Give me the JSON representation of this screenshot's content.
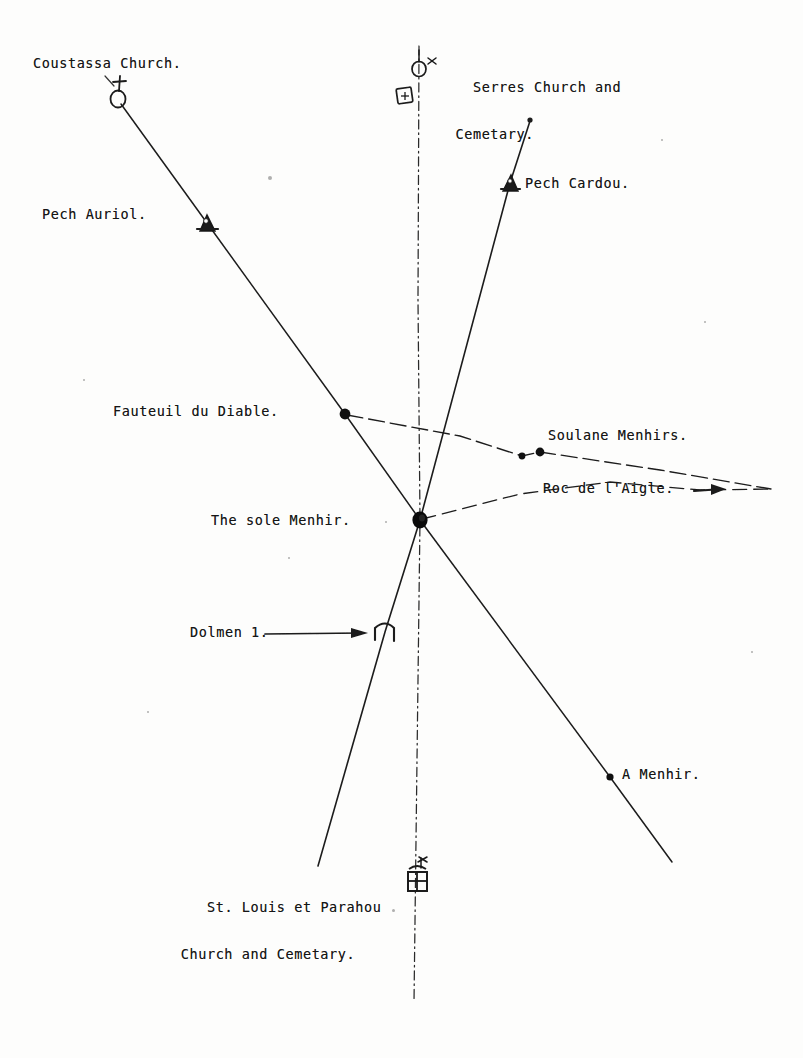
{
  "document": {
    "title": "Alignment plan of the sole Menhir",
    "medium": "typewritten and hand-drawn survey diagram",
    "background_color": "#fdfdfc",
    "ink_color": "#161616",
    "width": 803,
    "height": 1058
  },
  "labels": [
    {
      "id": "coustassa-church",
      "text": "Coustassa Church.",
      "x": 33,
      "y": 52,
      "lines": [
        "Coustassa Church."
      ]
    },
    {
      "id": "serres-church",
      "text": "Serres Church and Cemetary.",
      "x": 438,
      "y": 52,
      "lines": [
        "Serres Church and",
        "  Cemetary."
      ]
    },
    {
      "id": "pech-cardou",
      "text": "Pech Cardou.",
      "x": 525,
      "y": 172,
      "lines": [
        "Pech Cardou."
      ]
    },
    {
      "id": "pech-auriol",
      "text": "Pech Auriol.",
      "x": 42,
      "y": 203,
      "lines": [
        "Pech Auriol."
      ]
    },
    {
      "id": "fauteuil-du-diable",
      "text": "Fauteuil du Diable.",
      "x": 113,
      "y": 400,
      "lines": [
        "Fauteuil du Diable."
      ]
    },
    {
      "id": "soulane-menhirs",
      "text": "Soulane Menhirs.",
      "x": 548,
      "y": 424,
      "lines": [
        "Soulane Menhirs."
      ]
    },
    {
      "id": "roc-de-laigle",
      "text": "Roc de l'Aigle.",
      "x": 543,
      "y": 477,
      "lines": [
        "Roc de l'Aigle."
      ]
    },
    {
      "id": "the-sole-menhir",
      "text": "The sole Menhir.",
      "x": 211,
      "y": 509,
      "lines": [
        "The sole Menhir."
      ]
    },
    {
      "id": "dolmen-1",
      "text": "Dolmen 1.",
      "x": 190,
      "y": 621,
      "lines": [
        "Dolmen 1."
      ]
    },
    {
      "id": "a-menhir",
      "text": "A Menhir.",
      "x": 622,
      "y": 763,
      "lines": [
        "A Menhir."
      ]
    },
    {
      "id": "st-louis-et-parahou",
      "text": "St. Louis et Parahou Church and Cemetary.",
      "x": 172,
      "y": 872,
      "lines": [
        "St. Louis et Parahou",
        " Church and Cemetary."
      ]
    }
  ],
  "map_features": {
    "lines": [
      {
        "id": "coustassa-axis",
        "name": "Coustassa Church to A Menhir alignment",
        "style": "solid-hand-drawn",
        "from": [
          118,
          100
        ],
        "to": [
          672,
          862
        ],
        "through": [
          "coustassa-church-symbol",
          "pech-auriol-symbol",
          "fauteuil-du-diable-dot",
          "sole-menhir-hub",
          "a-menhir-dot"
        ]
      },
      {
        "id": "serres-meridian",
        "name": "Serres Church to St. Louis et Parahou meridian",
        "style": "dash-dot vertical",
        "from": [
          419,
          46
        ],
        "to": [
          414,
          1002
        ],
        "through": [
          "serres-church-symbol",
          "serres-cemetery-symbol",
          "sole-menhir-hub",
          "parahou-church-symbol"
        ]
      },
      {
        "id": "pech-cardou-axis",
        "name": "Pech Cardou to St. Louis et Parahou alignment",
        "style": "solid-hand-drawn",
        "from": [
          530,
          120
        ],
        "to": [
          318,
          866
        ],
        "through": [
          "pech-cardou-symbol",
          "sole-menhir-hub",
          "dolmen-1-symbol"
        ]
      },
      {
        "id": "soulane-axis",
        "name": "Fauteuil du Diable to Soulane Menhirs alignment",
        "style": "dashed",
        "from": [
          345,
          414
        ],
        "to": [
          771,
          489
        ],
        "through": [
          "fauteuil-du-diable-dot",
          "soulane-menhir-dot-1",
          "soulane-menhir-dot-2"
        ]
      },
      {
        "id": "roc-de-laigle-axis",
        "name": "Sole Menhir to Roc de l'Aigle alignment",
        "style": "dashed",
        "from": [
          420,
          520
        ],
        "to": [
          771,
          489
        ],
        "through": [
          "sole-menhir-hub",
          "roc-de-laigle-arrow"
        ]
      }
    ],
    "symbols": [
      {
        "id": "coustassa-church-symbol",
        "kind": "church-symbol",
        "glyph": "circle-with-cross",
        "x": 118,
        "y": 98,
        "label_ref": "coustassa-church"
      },
      {
        "id": "serres-church-symbol",
        "kind": "church-symbol",
        "glyph": "circle-with-cross",
        "x": 419,
        "y": 68,
        "label_ref": "serres-church"
      },
      {
        "id": "serres-cemetery-symbol",
        "kind": "cemetery-symbol",
        "glyph": "square-with-cross",
        "x": 405,
        "y": 96,
        "label_ref": "serres-church"
      },
      {
        "id": "pech-auriol-symbol",
        "kind": "hill-summit-symbol",
        "glyph": "triangle-peak",
        "x": 207,
        "y": 223,
        "label_ref": "pech-auriol"
      },
      {
        "id": "pech-cardou-symbol",
        "kind": "hill-summit-symbol",
        "glyph": "triangle-peak",
        "x": 510,
        "y": 183,
        "label_ref": "pech-cardou"
      },
      {
        "id": "fauteuil-du-diable-dot",
        "kind": "station-dot",
        "glyph": "filled-circle",
        "x": 345,
        "y": 414,
        "label_ref": "fauteuil-du-diable"
      },
      {
        "id": "soulane-menhir-dot-1",
        "kind": "menhir-dot",
        "glyph": "filled-circle",
        "x": 522,
        "y": 456,
        "label_ref": "soulane-menhirs"
      },
      {
        "id": "soulane-menhir-dot-2",
        "kind": "menhir-dot",
        "glyph": "filled-circle",
        "x": 540,
        "y": 452,
        "label_ref": "soulane-menhirs"
      },
      {
        "id": "sole-menhir-hub",
        "kind": "menhir-hub",
        "glyph": "large-filled-circle",
        "x": 420,
        "y": 520,
        "label_ref": "the-sole-menhir"
      },
      {
        "id": "dolmen-1-symbol",
        "kind": "dolmen-symbol",
        "glyph": "trilithon",
        "x": 385,
        "y": 632,
        "label_ref": "dolmen-1"
      },
      {
        "id": "a-menhir-dot",
        "kind": "menhir-dot",
        "glyph": "filled-circle",
        "x": 610,
        "y": 777,
        "label_ref": "a-menhir"
      },
      {
        "id": "parahou-church-symbol",
        "kind": "church-and-cemetery-symbol",
        "glyph": "square-with-cross-and-flag",
        "x": 417,
        "y": 880,
        "label_ref": "st-louis-et-parahou"
      }
    ],
    "pointers": [
      {
        "id": "dolmen-1-pointer",
        "kind": "leader-arrow",
        "from": [
          265,
          634
        ],
        "to": [
          370,
          633
        ],
        "target": "dolmen-1-symbol"
      },
      {
        "id": "roc-de-laigle-pointer",
        "kind": "leader-arrow",
        "from": [
          697,
          491
        ],
        "to": [
          724,
          489
        ],
        "target": "roc-de-laigle-axis"
      }
    ],
    "specks": [
      {
        "x": 270,
        "y": 178,
        "r": 2.0
      },
      {
        "x": 84,
        "y": 380,
        "r": 1.3
      },
      {
        "x": 386,
        "y": 522,
        "r": 1.4
      },
      {
        "x": 289,
        "y": 558,
        "r": 1.2
      },
      {
        "x": 393,
        "y": 910,
        "r": 1.5
      },
      {
        "x": 705,
        "y": 322,
        "r": 1.2
      },
      {
        "x": 752,
        "y": 652,
        "r": 1.2
      },
      {
        "x": 662,
        "y": 140,
        "r": 1.1
      },
      {
        "x": 148,
        "y": 712,
        "r": 1.1
      }
    ]
  }
}
